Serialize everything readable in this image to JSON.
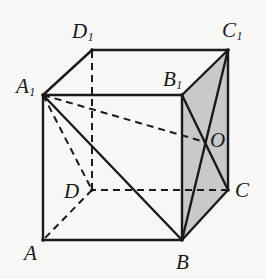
{
  "figure": {
    "kind": "solid-geometry-cube-diagram",
    "name": "Cube ABCD-A1B1C1D1 with shaded face BCC1B1 and center O",
    "background_color": "#f7f7f5",
    "stroke_color": "#1a1a1a",
    "shaded_face_color": "#c9c9c9",
    "shaded_face_name": "BCC1B1",
    "canvas": {
      "width": 266,
      "height": 279
    }
  },
  "vertices": [
    {
      "id": "A",
      "label": "A",
      "sub": "",
      "x": 43,
      "y": 240,
      "label_x": 24,
      "label_y": 243
    },
    {
      "id": "B",
      "label": "B",
      "sub": "",
      "x": 182,
      "y": 240,
      "label_x": 176,
      "label_y": 252
    },
    {
      "id": "C",
      "label": "C",
      "sub": "",
      "x": 228,
      "y": 190,
      "label_x": 235,
      "label_y": 180
    },
    {
      "id": "D",
      "label": "D",
      "sub": "",
      "x": 92,
      "y": 190,
      "label_x": 64,
      "label_y": 181
    },
    {
      "id": "A1",
      "label": "A",
      "sub": "1",
      "x": 43,
      "y": 95,
      "label_x": 16,
      "label_y": 76
    },
    {
      "id": "B1",
      "label": "B",
      "sub": "1",
      "x": 182,
      "y": 95,
      "label_x": 163,
      "label_y": 69
    },
    {
      "id": "C1",
      "label": "C",
      "sub": "1",
      "x": 228,
      "y": 50,
      "label_x": 222,
      "label_y": 20
    },
    {
      "id": "D1",
      "label": "D",
      "sub": "1",
      "x": 92,
      "y": 50,
      "label_x": 72,
      "label_y": 21
    },
    {
      "id": "O",
      "label": "O",
      "sub": "",
      "x": 205,
      "y": 142,
      "label_x": 210,
      "label_y": 130
    }
  ],
  "edges": [
    {
      "name": "edge-A-B",
      "from": "A",
      "to": "B",
      "style": "solid"
    },
    {
      "name": "edge-B-C",
      "from": "B",
      "to": "C",
      "style": "solid"
    },
    {
      "name": "edge-C-D",
      "from": "C",
      "to": "D",
      "style": "dashed"
    },
    {
      "name": "edge-D-A",
      "from": "D",
      "to": "A",
      "style": "dashed"
    },
    {
      "name": "edge-A1-B1",
      "from": "A1",
      "to": "B1",
      "style": "solid"
    },
    {
      "name": "edge-B1-C1",
      "from": "B1",
      "to": "C1",
      "style": "solid"
    },
    {
      "name": "edge-C1-D1",
      "from": "C1",
      "to": "D1",
      "style": "solid"
    },
    {
      "name": "edge-D1-A1",
      "from": "D1",
      "to": "A1",
      "style": "solid"
    },
    {
      "name": "edge-A-A1",
      "from": "A",
      "to": "A1",
      "style": "solid"
    },
    {
      "name": "edge-B-B1",
      "from": "B",
      "to": "B1",
      "style": "solid"
    },
    {
      "name": "edge-C-C1",
      "from": "C",
      "to": "C1",
      "style": "solid"
    },
    {
      "name": "edge-D-D1",
      "from": "D",
      "to": "D1",
      "style": "dashed"
    }
  ],
  "construction_lines": [
    {
      "name": "line-A1-B",
      "from": "A1",
      "to": "B",
      "style": "solid"
    },
    {
      "name": "line-A1-D",
      "from": "A1",
      "to": "D",
      "style": "dashed"
    },
    {
      "name": "line-A1-O",
      "from": "A1",
      "to": "O",
      "style": "dashed"
    },
    {
      "name": "line-B-C1",
      "from": "B",
      "to": "C1",
      "style": "solid"
    },
    {
      "name": "line-C-B1",
      "from": "C",
      "to": "B1",
      "style": "solid"
    }
  ],
  "shaded_face": {
    "name": "face-BCC1B1",
    "points": "182,240 228,190 228,50 182,95"
  }
}
